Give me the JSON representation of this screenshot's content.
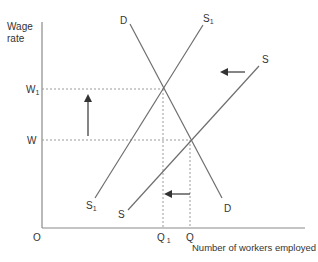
{
  "diagram": {
    "colors": {
      "line": "#6e6e6e",
      "axis": "#8a8a8a",
      "guide": "#9a9a9a",
      "arrow": "#333333",
      "text": "#333333"
    },
    "y_axis_label_line1": "Wage",
    "y_axis_label_line2": "rate",
    "x_axis_label": "Number of workers employed",
    "origin_label": "O",
    "wage_levels": {
      "w1_main": "W",
      "w1_sub": "1",
      "w_main": "W"
    },
    "quantity_levels": {
      "q1_main": "Q",
      "q1_sub": "1",
      "q_main": "Q"
    },
    "curves": {
      "demand_top": "D",
      "demand_bottom": "D",
      "supply1_top_main": "S",
      "supply1_top_sub": "1",
      "supply1_bottom_main": "S",
      "supply1_bottom_sub": "1",
      "supply_top": "S",
      "supply_bottom": "S"
    },
    "annotations": {
      "wage_shift": "upward arrow: wage rises from W to W1",
      "supply_shift": "leftward arrow: supply shifts from S to S1",
      "quantity_shift": "leftward arrow: employment falls from Q to Q1"
    }
  }
}
